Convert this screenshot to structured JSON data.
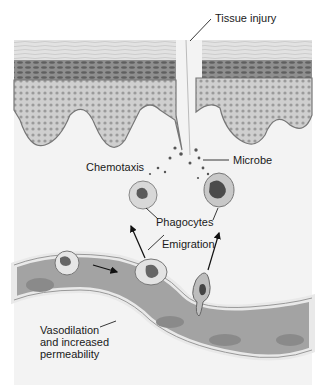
{
  "diagram": {
    "labels": {
      "tissue_injury": "Tissue injury",
      "chemotaxis": "Chemotaxis",
      "microbe": "Microbe",
      "phagocytes": "Phagocytes",
      "emigration": "Emigration",
      "vasodilation": "Vasodilation and increased permeability"
    },
    "colors": {
      "background": "#ffffff",
      "stratum_corneum": "#dcdcdc",
      "epidermis_dark": "#8a8a8a",
      "epidermis_light": "#c8c8c8",
      "dermis": "#f1f1f1",
      "vessel_wall": "#eeeeee",
      "vessel_lumen": "#9a9a9a",
      "cell": "#d4d4d4",
      "nucleus": "#5a5a5a",
      "text": "#1a1a1a"
    }
  }
}
